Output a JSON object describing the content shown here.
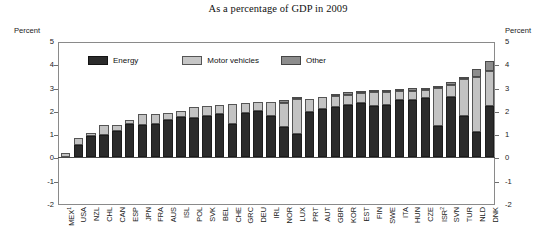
{
  "title": "As a percentage of GDP in 2009",
  "axis": {
    "left_unit": "Percent",
    "right_unit": "Percent",
    "ticks": [
      "5",
      "4",
      "3",
      "2",
      "1",
      "0",
      "-1",
      "-2"
    ]
  },
  "legend": {
    "items": [
      {
        "label": "Energy",
        "color": "#2b2b2b",
        "key": "energy"
      },
      {
        "label": "Motor vehicles",
        "color": "#c6c6c6",
        "key": "motor"
      },
      {
        "label": "Other",
        "color": "#8d8d8d",
        "key": "other"
      }
    ]
  },
  "footnote_markers": {
    "MEX": "1",
    "ISR": "2"
  },
  "chart_data": {
    "type": "bar",
    "stacked": true,
    "title": "As a percentage of GDP in 2009",
    "xlabel": "",
    "ylabel": "Percent",
    "ylim": [
      -2,
      5
    ],
    "yticks": [
      -2,
      -1,
      0,
      1,
      2,
      3,
      4,
      5
    ],
    "grid": false,
    "legend_position": "inside-top-left",
    "categories": [
      "MEX",
      "USA",
      "NZL",
      "CHL",
      "CAN",
      "ESP",
      "JPN",
      "FRA",
      "AUS",
      "ISL",
      "POL",
      "SVK",
      "BEL",
      "CHE",
      "GRC",
      "DEU",
      "IRL",
      "NOR",
      "LUX",
      "PRT",
      "AUT",
      "GBR",
      "KOR",
      "EST",
      "FIN",
      "SWE",
      "ITA",
      "HUN",
      "CZE",
      "ISR",
      "SVN",
      "TUR",
      "NLD",
      "DNK"
    ],
    "category_labels": [
      "MEX¹",
      "USA",
      "NZL",
      "CHL",
      "CAN",
      "ESP",
      "JPN",
      "FRA",
      "AUS",
      "ISL",
      "POL",
      "SVK",
      "BEL",
      "CHE",
      "GRC",
      "DEU",
      "IRL",
      "NOR",
      "LUX",
      "PRT",
      "AUT",
      "GBR",
      "KOR",
      "EST",
      "FIN",
      "SWE",
      "ITA",
      "HUN",
      "CZE",
      "ISR²",
      "SVN",
      "TUR",
      "NLD",
      "DNK"
    ],
    "series": [
      {
        "name": "Energy",
        "color": "#2b2b2b",
        "values": [
          0.0,
          0.55,
          0.9,
          0.95,
          1.15,
          1.45,
          1.4,
          1.45,
          1.6,
          1.75,
          1.7,
          1.8,
          1.85,
          1.45,
          1.9,
          2.0,
          1.8,
          1.3,
          1.0,
          1.95,
          2.1,
          2.15,
          2.25,
          2.35,
          2.2,
          2.25,
          2.45,
          2.45,
          2.55,
          1.35,
          2.6,
          1.8,
          1.1,
          2.2
        ]
      },
      {
        "name": "Motor vehicles",
        "color": "#c6c6c6",
        "values": [
          0.2,
          0.3,
          0.15,
          0.45,
          0.25,
          0.15,
          0.45,
          0.4,
          0.3,
          0.25,
          0.45,
          0.4,
          0.4,
          0.85,
          0.45,
          0.4,
          0.6,
          1.05,
          1.5,
          0.55,
          0.5,
          0.5,
          0.45,
          0.4,
          0.6,
          0.55,
          0.4,
          0.4,
          0.35,
          1.65,
          0.5,
          1.55,
          2.35,
          1.5
        ]
      },
      {
        "name": "Other",
        "color": "#8d8d8d",
        "values": [
          0.0,
          0.0,
          0.0,
          0.0,
          0.0,
          0.0,
          0.0,
          0.0,
          0.0,
          0.0,
          0.0,
          0.0,
          0.0,
          0.0,
          0.0,
          0.0,
          0.0,
          0.1,
          0.1,
          0.0,
          0.0,
          0.05,
          0.1,
          0.05,
          0.1,
          0.1,
          0.1,
          0.15,
          0.1,
          0.05,
          0.15,
          0.05,
          0.35,
          0.45
        ]
      }
    ],
    "totals": [
      0.2,
      0.85,
      1.05,
      1.4,
      1.4,
      1.6,
      1.85,
      1.85,
      1.9,
      2.0,
      2.15,
      2.2,
      2.25,
      2.3,
      2.35,
      2.4,
      2.4,
      2.45,
      2.6,
      2.5,
      2.6,
      2.7,
      2.8,
      2.8,
      2.9,
      2.9,
      2.95,
      3.0,
      3.0,
      3.05,
      3.25,
      3.4,
      3.8,
      4.15
    ]
  }
}
